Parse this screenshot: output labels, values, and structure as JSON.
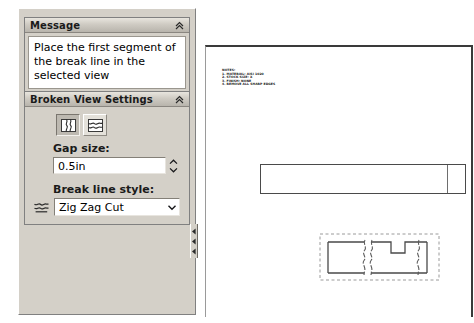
{
  "window": {
    "app": "SolidWorks Drawing",
    "command": "Broken View"
  },
  "message_panel": {
    "title": "Message",
    "collapse_icon": "double-chevron-up-icon",
    "text": "Place the first segment of the break line in the selected view"
  },
  "broken_view_panel": {
    "title": "Broken View Settings",
    "collapse_icon": "double-chevron-up-icon",
    "orientation_buttons": [
      {
        "name": "add-vertical-break-line",
        "icon": "vertical-break-icon",
        "selected": true
      },
      {
        "name": "add-horizontal-break-line",
        "icon": "horizontal-break-icon",
        "selected": false
      }
    ],
    "gap_size": {
      "label": "Gap size:",
      "value": "0.5in",
      "spinner_up_icon": "chevron-up-icon",
      "spinner_down_icon": "chevron-down-icon"
    },
    "break_line_style": {
      "label": "Break line style:",
      "glyph_icon": "zig-zag-cut-icon",
      "value": "Zig Zag Cut",
      "dropdown_icon": "chevron-down-icon",
      "options": [
        "Straight Cut",
        "Curve Cut",
        "Zig Zag Cut",
        "Small Zig Zag Cut",
        "Jagged Cut"
      ]
    }
  },
  "splitter": {
    "name": "panel-splitter-handle",
    "arrow_icon": "left-arrow-icon",
    "arrow_count": 3
  },
  "drawing_sheet": {
    "notes": [
      "NOTES:",
      "1. MATERIAL: AISI 1020",
      "2. STOCK SIZE: X",
      "3. FINISH: NONE",
      "4. REMOVE ALL SHARP EDGES"
    ],
    "unbroken_view": {
      "name": "drawing-view-unbroken"
    },
    "broken_view": {
      "name": "drawing-view-broken-preview",
      "selection_border": "dashed",
      "break_line_count": 2
    }
  },
  "colors": {
    "panel_face": "#d4d0c8",
    "header_gradient_top": "#e8e5de",
    "header_gradient_bottom": "#b8b4ac",
    "field_background": "#ffffff",
    "sheet_background": "#ffffff",
    "geometry_line": "#4a4a4a",
    "selection_dash": "#9a9a9a"
  }
}
